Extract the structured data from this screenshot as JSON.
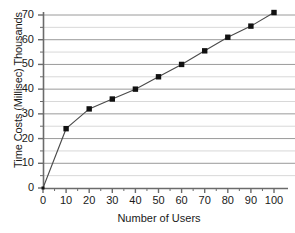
{
  "chart_data": {
    "type": "line",
    "title": "",
    "xlabel": "Number of Users",
    "ylabel": "Time Costs (Millisec) Thousands",
    "xlim": [
      0,
      103
    ],
    "ylim": [
      0,
      73
    ],
    "xticks": [
      0,
      10,
      20,
      30,
      40,
      50,
      60,
      70,
      80,
      90,
      100
    ],
    "yticks": [
      0,
      10,
      20,
      30,
      40,
      50,
      60,
      70
    ],
    "grid": "horizontal major and minor",
    "legend": "none",
    "marker": "filled square",
    "line_color": "#4a4a4a",
    "marker_color": "#111111",
    "grid_color": "#9a9a9a",
    "minor_grid_color": "#d8d8d8",
    "axis_color": "#6b6b6b",
    "x": [
      0,
      10,
      20,
      30,
      40,
      50,
      60,
      70,
      80,
      90,
      100
    ],
    "values": [
      0,
      24,
      32,
      36,
      40,
      45,
      50,
      55.5,
      61,
      65.5,
      71
    ],
    "series": [
      {
        "name": "Time Costs",
        "points": [
          {
            "x": 0,
            "y": 0
          },
          {
            "x": 10,
            "y": 24
          },
          {
            "x": 20,
            "y": 32
          },
          {
            "x": 30,
            "y": 36
          },
          {
            "x": 40,
            "y": 40
          },
          {
            "x": 50,
            "y": 45
          },
          {
            "x": 60,
            "y": 50
          },
          {
            "x": 70,
            "y": 55.5
          },
          {
            "x": 80,
            "y": 61
          },
          {
            "x": 90,
            "y": 65.5
          },
          {
            "x": 100,
            "y": 71
          }
        ]
      }
    ]
  },
  "axes": {
    "x_tick_labels": [
      "0",
      "10",
      "20",
      "30",
      "40",
      "50",
      "60",
      "70",
      "80",
      "90",
      "100"
    ],
    "y_tick_labels": [
      "0",
      "10",
      "20",
      "30",
      "40",
      "50",
      "60",
      "70"
    ]
  }
}
